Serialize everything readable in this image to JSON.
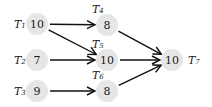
{
  "diagram": {
    "type": "task-dependency-graph",
    "nodes": [
      {
        "id": "T1",
        "label": "T",
        "sub": "1",
        "weight": "10",
        "cx": 37,
        "cy": 24,
        "lx": 14,
        "ly": 24
      },
      {
        "id": "T2",
        "label": "T",
        "sub": "2",
        "weight": "7",
        "cx": 37,
        "cy": 60,
        "lx": 14,
        "ly": 60
      },
      {
        "id": "T3",
        "label": "T",
        "sub": "3",
        "weight": "9",
        "cx": 37,
        "cy": 91,
        "lx": 14,
        "ly": 91
      },
      {
        "id": "T4",
        "label": "T",
        "sub": "4",
        "weight": "8",
        "cx": 107,
        "cy": 25,
        "lx": 92,
        "ly": 9
      },
      {
        "id": "T5",
        "label": "T",
        "sub": "5",
        "weight": "10",
        "cx": 107,
        "cy": 60,
        "lx": 92,
        "ly": 44
      },
      {
        "id": "T6",
        "label": "T",
        "sub": "6",
        "weight": "8",
        "cx": 107,
        "cy": 91,
        "lx": 92,
        "ly": 75
      },
      {
        "id": "T7",
        "label": "T",
        "sub": "7",
        "weight": "10",
        "cx": 172,
        "cy": 60,
        "lx": 188,
        "ly": 60
      }
    ],
    "edges": [
      {
        "from": "T1",
        "to": "T4"
      },
      {
        "from": "T1",
        "to": "T5"
      },
      {
        "from": "T2",
        "to": "T5"
      },
      {
        "from": "T3",
        "to": "T6"
      },
      {
        "from": "T4",
        "to": "T7"
      },
      {
        "from": "T5",
        "to": "T7"
      },
      {
        "from": "T6",
        "to": "T7"
      }
    ],
    "colors": {
      "node_fill": "#e6e6e6",
      "edge": "#111111",
      "text": "#1a1a1a"
    }
  }
}
